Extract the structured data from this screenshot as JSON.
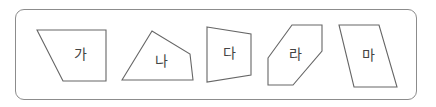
{
  "frame": {
    "border_color": "#8c8c8c",
    "corner_radius": 9
  },
  "shapes": [
    {
      "label": "가",
      "points": "37,30 106,30 106,81 63,81",
      "label_x": 80,
      "label_y": 55
    },
    {
      "label": "나",
      "points": "122,80 152,31 190,54 193,80",
      "label_x": 161,
      "label_y": 62
    },
    {
      "label": "다",
      "points": "207,27 251,34 251,75 207,82",
      "label_x": 229,
      "label_y": 54
    },
    {
      "label": "라",
      "points": "268,58 292,25 322,25 322,51 293,85 268,85",
      "label_x": 295,
      "label_y": 55
    },
    {
      "label": "마",
      "points": "339,25 379,25 397,87 354,87",
      "label_x": 368,
      "label_y": 56
    }
  ]
}
